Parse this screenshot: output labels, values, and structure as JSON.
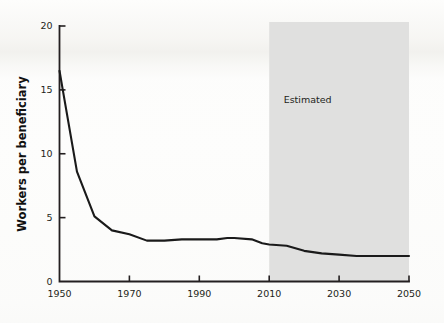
{
  "chart_data": {
    "type": "line",
    "title": "",
    "xlabel": "",
    "ylabel": "Workers per beneficiary",
    "xlim": [
      1950,
      2050
    ],
    "ylim": [
      0,
      20
    ],
    "grid": false,
    "legend": null,
    "x_ticks": [
      "1950",
      "1970",
      "1990",
      "2010",
      "2030",
      "2050"
    ],
    "x_tick_values": [
      1950,
      1970,
      1990,
      2010,
      2030,
      2050
    ],
    "y_ticks": [
      "0",
      "5",
      "10",
      "15",
      "20"
    ],
    "y_tick_values": [
      0,
      5,
      10,
      15,
      20
    ],
    "annotations": [
      {
        "text": "Estimated",
        "x": 2021,
        "y": 14.0,
        "kind": "shaded-region-label"
      }
    ],
    "shaded_regions": [
      {
        "label": "Estimated",
        "x_start": 2010,
        "x_end": 2050,
        "y_start": 0,
        "y_end": 20,
        "color": "#dededd"
      }
    ],
    "series": [
      {
        "name": "Workers per beneficiary",
        "color": "#1a1a1a",
        "x": [
          1950,
          1951,
          1955,
          1960,
          1965,
          1970,
          1975,
          1980,
          1985,
          1990,
          1995,
          1998,
          2000,
          2005,
          2008,
          2010,
          2015,
          2020,
          2025,
          2030,
          2035,
          2040,
          2045,
          2050
        ],
        "values": [
          16.5,
          14.9,
          8.6,
          5.1,
          4.0,
          3.7,
          3.2,
          3.2,
          3.3,
          3.3,
          3.3,
          3.4,
          3.4,
          3.3,
          3.0,
          2.9,
          2.8,
          2.4,
          2.2,
          2.1,
          2.0,
          2.0,
          2.0,
          2.0
        ]
      }
    ]
  },
  "colors": {
    "line": "#1a1a1a",
    "axis": "#231f20",
    "shade": "#dededd",
    "background": "#fdfdfc"
  }
}
